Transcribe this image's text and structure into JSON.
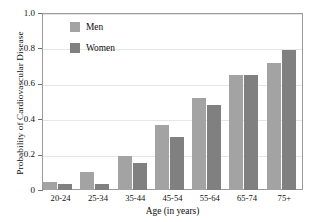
{
  "chart_data": {
    "type": "bar",
    "title": "",
    "xlabel": "Age (in years)",
    "ylabel": "Probability of Cardiovascular Disease",
    "categories": [
      "20-24",
      "25-34",
      "35-44",
      "45-54",
      "55-64",
      "65-74",
      "75+"
    ],
    "series": [
      {
        "name": "Men",
        "color": "#a3a3a3",
        "values": [
          0.045,
          0.1,
          0.19,
          0.365,
          0.52,
          0.65,
          0.715
        ]
      },
      {
        "name": "Women",
        "color": "#808080",
        "values": [
          0.033,
          0.033,
          0.15,
          0.3,
          0.48,
          0.65,
          0.79
        ]
      }
    ],
    "ylim": [
      0,
      1.0
    ],
    "ytick_labels": [
      "0",
      "0.2",
      "0.4",
      "0.6",
      "0.8",
      "1.0"
    ],
    "ytick_values": [
      0,
      0.2,
      0.4,
      0.6,
      0.8,
      1.0
    ],
    "grid": true,
    "legend_position": "upper-left-inside"
  },
  "legend": {
    "entries": [
      {
        "label": "Men"
      },
      {
        "label": "Women"
      }
    ]
  },
  "axes": {
    "y_title": "Probability of Cardiovascular Disease",
    "x_title": "Age (in years)"
  }
}
